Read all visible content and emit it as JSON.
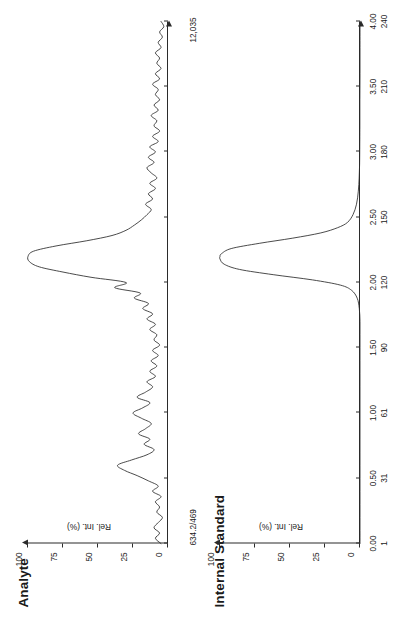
{
  "figure": {
    "type": "dual-panel chromatogram",
    "orientation": "rotated 90 degrees counter-clockwise on page"
  },
  "panels": {
    "analyte": {
      "title": "Analyte",
      "mass_transition": "634.2/469",
      "intensity_label": "12,035",
      "ylabel": "Rel. Int. (%)",
      "yticks": [
        "0",
        "25",
        "50",
        "75",
        "100"
      ]
    },
    "internal_standard": {
      "title": "Internal Standard",
      "ylabel": "Rel. Int. (%)",
      "yticks": [
        "0",
        "25",
        "50",
        "75",
        "100"
      ],
      "xlabel": "Time (min)/Scan"
    }
  },
  "xaxis": {
    "time_ticks": [
      "0.00",
      "0.50",
      "1.00",
      "1.50",
      "2.00",
      "2.50",
      "3.00",
      "3.50",
      "4.00"
    ],
    "scan_ticks": [
      "1",
      "31",
      "61",
      "90",
      "120",
      "150",
      "180",
      "210",
      "240"
    ],
    "label": "Time (min)/Scan",
    "range": [
      0.0,
      4.0
    ]
  },
  "chart_data": {
    "type": "line",
    "title": "",
    "xlabel": "Time (min)/Scan",
    "ylabel": "Rel. Int. (%)",
    "xlim": [
      0.0,
      4.0
    ],
    "ylim": [
      0,
      100
    ],
    "grid": false,
    "legend": "none",
    "xtick_labels_time": [
      "0.00",
      "0.50",
      "1.00",
      "1.50",
      "2.00",
      "2.50",
      "3.00",
      "3.50",
      "4.00"
    ],
    "xtick_labels_scan": [
      "1",
      "31",
      "61",
      "90",
      "120",
      "150",
      "180",
      "210",
      "240"
    ],
    "ytick_labels": [
      "0",
      "25",
      "50",
      "75",
      "100"
    ],
    "annotations": [
      {
        "panel": "Analyte",
        "text": "634.2/469",
        "role": "mass transition"
      },
      {
        "panel": "Analyte",
        "text": "12,035",
        "role": "absolute intensity of base peak"
      }
    ],
    "series": [
      {
        "name": "Analyte",
        "panel": "analyte",
        "base_peak_intensity": 12035,
        "peaks": [
          {
            "retention_time": 0.6,
            "rel_intensity": 36,
            "note": "interference / early peak"
          },
          {
            "retention_time": 2.2,
            "rel_intensity": 100,
            "note": "analyte peak"
          }
        ],
        "baseline_noise_rel_intensity": 8,
        "x": [
          0.0,
          0.04,
          0.08,
          0.12,
          0.16,
          0.2,
          0.24,
          0.28,
          0.32,
          0.36,
          0.4,
          0.44,
          0.48,
          0.52,
          0.56,
          0.6,
          0.64,
          0.68,
          0.72,
          0.76,
          0.8,
          0.84,
          0.88,
          0.92,
          0.96,
          1.0,
          1.04,
          1.08,
          1.12,
          1.16,
          1.2,
          1.24,
          1.28,
          1.32,
          1.36,
          1.4,
          1.44,
          1.48,
          1.52,
          1.56,
          1.6,
          1.64,
          1.68,
          1.72,
          1.76,
          1.8,
          1.84,
          1.88,
          1.92,
          1.96,
          2.0,
          2.04,
          2.08,
          2.12,
          2.16,
          2.2,
          2.24,
          2.28,
          2.32,
          2.36,
          2.4,
          2.44,
          2.48,
          2.52,
          2.56,
          2.6,
          2.64,
          2.68,
          2.72,
          2.76,
          2.8,
          2.84,
          2.88,
          2.92,
          2.96,
          3.0,
          3.04,
          3.08,
          3.12,
          3.16,
          3.2,
          3.24,
          3.28,
          3.32,
          3.36,
          3.4,
          3.44,
          3.48,
          3.52,
          3.56,
          3.6,
          3.64,
          3.68,
          3.72,
          3.76,
          3.8,
          3.84,
          3.88,
          3.92,
          3.96,
          4.0
        ],
        "y": [
          5,
          9,
          6,
          10,
          7,
          4,
          8,
          6,
          9,
          5,
          11,
          7,
          14,
          22,
          31,
          36,
          26,
          15,
          10,
          17,
          13,
          21,
          16,
          12,
          19,
          25,
          18,
          13,
          22,
          16,
          11,
          15,
          9,
          13,
          8,
          12,
          7,
          11,
          6,
          10,
          8,
          13,
          9,
          15,
          11,
          18,
          14,
          24,
          20,
          38,
          30,
          55,
          75,
          92,
          99,
          100,
          96,
          80,
          58,
          40,
          30,
          24,
          19,
          15,
          12,
          16,
          11,
          14,
          9,
          13,
          8,
          12,
          15,
          10,
          14,
          9,
          13,
          7,
          11,
          6,
          10,
          8,
          12,
          7,
          10,
          6,
          9,
          7,
          11,
          6,
          9,
          5,
          8,
          6,
          9,
          5,
          7,
          4,
          6,
          3,
          5
        ]
      },
      {
        "name": "Internal Standard",
        "panel": "internal_standard",
        "peaks": [
          {
            "retention_time": 2.2,
            "rel_intensity": 100,
            "note": "internal standard peak"
          }
        ],
        "baseline_noise_rel_intensity": 0,
        "x": [
          0.0,
          0.1,
          0.2,
          0.3,
          0.4,
          0.5,
          0.6,
          0.7,
          0.8,
          0.9,
          1.0,
          1.1,
          1.2,
          1.3,
          1.4,
          1.5,
          1.6,
          1.7,
          1.8,
          1.88,
          1.94,
          1.98,
          2.02,
          2.06,
          2.1,
          2.14,
          2.18,
          2.2,
          2.22,
          2.26,
          2.3,
          2.34,
          2.38,
          2.42,
          2.46,
          2.52,
          2.6,
          2.7,
          2.8,
          2.9,
          3.0,
          3.2,
          3.4,
          3.6,
          3.8,
          4.0
        ],
        "y": [
          0,
          0,
          0,
          0,
          0,
          0,
          0,
          0,
          0,
          0,
          0,
          0,
          0,
          0,
          0,
          0,
          0,
          0,
          0.5,
          2,
          6,
          14,
          34,
          62,
          86,
          97,
          100,
          100,
          99,
          92,
          72,
          48,
          28,
          16,
          9,
          5,
          2.5,
          1.2,
          0.6,
          0.3,
          0.2,
          0.1,
          0.1,
          0,
          0,
          0
        ]
      }
    ]
  }
}
